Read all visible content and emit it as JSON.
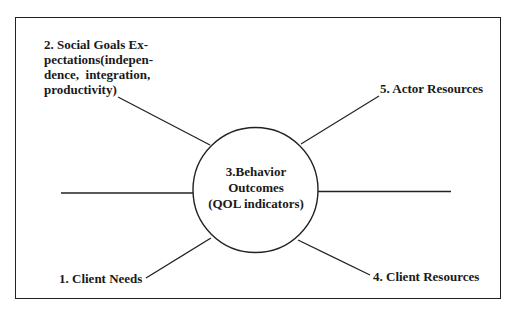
{
  "diagram": {
    "center": {
      "lines": [
        "3.Behavior",
        "Outcomes",
        "(QOL indicators)"
      ]
    },
    "nodes": [
      {
        "id": "1",
        "label": "1. Client Needs"
      },
      {
        "id": "2",
        "lines": [
          "2. Social Goals Ex-",
          "pectations(indepen-",
          "dence,  integration,",
          "productivity)"
        ]
      },
      {
        "id": "4",
        "label": "4. Client Resources"
      },
      {
        "id": "5",
        "label": "5. Actor Resources"
      }
    ],
    "colors": {
      "stroke": "#222222",
      "text": "#1a1a1a",
      "background": "#ffffff"
    }
  }
}
